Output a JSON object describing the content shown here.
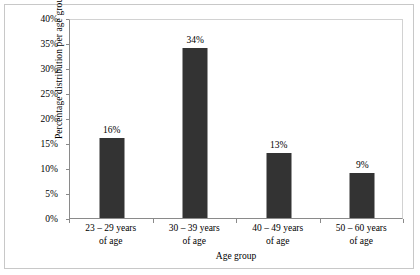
{
  "chart_data": {
    "type": "bar",
    "title": "",
    "xlabel": "Age group",
    "ylabel": "Percentage distribution per age group",
    "categories": [
      "23 – 29 years\nof age",
      "30 – 39 years\nof age",
      "40 – 49 years\nof age",
      "50 – 60 years\nof age"
    ],
    "category_lines": [
      [
        "23 – 29 years",
        "of age"
      ],
      [
        "30 – 39 years",
        "of age"
      ],
      [
        "40 – 49 years",
        "of age"
      ],
      [
        "50 – 60 years",
        "of age"
      ]
    ],
    "values": [
      16,
      34,
      13,
      9
    ],
    "data_labels": [
      "16%",
      "34%",
      "13%",
      "9%"
    ],
    "ylim": [
      0,
      40
    ],
    "ytick_values": [
      0,
      5,
      10,
      15,
      20,
      25,
      30,
      35,
      40
    ],
    "ytick_labels": [
      "0%",
      "5%",
      "10%",
      "15%",
      "20%",
      "25%",
      "30%",
      "35%",
      "40%"
    ],
    "grid": false,
    "legend": false,
    "bar_color": "#333333",
    "axis_color": "#8a8a8a",
    "frame_color": "#c8c8c8",
    "background": "#ffffff"
  }
}
